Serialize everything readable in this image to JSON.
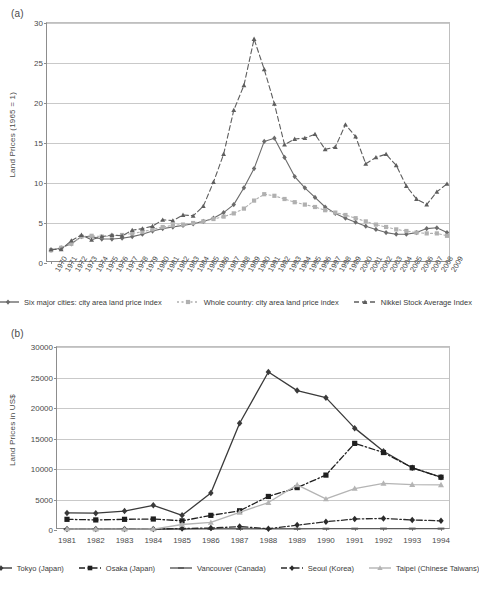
{
  "figure": {
    "panel_a_label": "(a)",
    "panel_b_label": "(b)"
  },
  "panel_a": {
    "ylabel": "Land Prices (1965 = 1)",
    "legend": [
      {
        "name": "six-major-cities",
        "label": "Six major cities: city area land price index",
        "color": "#6b6b6b",
        "marker": "diamond",
        "dash": "solid"
      },
      {
        "name": "whole-country",
        "label": "Whole country: city area land price index",
        "color": "#b0b0b0",
        "marker": "square",
        "dash": "dotted"
      },
      {
        "name": "nikkei",
        "label": "Nikkei Stock Average Index",
        "color": "#5e5e5e",
        "marker": "triangle",
        "dash": "dashed"
      }
    ]
  },
  "panel_b": {
    "ylabel": "Land Prices in US$",
    "legend": [
      {
        "name": "tokyo",
        "label": "Tokyo (Japan)",
        "color": "#3a3a3a",
        "marker": "diamond",
        "dash": "solid"
      },
      {
        "name": "osaka",
        "label": "Osaka (Japan)",
        "color": "#1f1f1f",
        "marker": "square",
        "dash": "dashdot"
      },
      {
        "name": "vancouver",
        "label": "Vancouver (Canada)",
        "color": "#5a5a5a",
        "marker": "dash",
        "dash": "solid"
      },
      {
        "name": "seoul",
        "label": "Seoul (Korea)",
        "color": "#2b2b2b",
        "marker": "diamond",
        "dash": "dashdot"
      },
      {
        "name": "taipei",
        "label": "Taipei (Chinese Taiwans)",
        "color": "#b4b4b4",
        "marker": "triangle",
        "dash": "solid"
      }
    ]
  },
  "chart_data": [
    {
      "type": "line",
      "panel": "(a)",
      "title": "",
      "xlabel": "",
      "ylabel": "Land Prices (1965 = 1)",
      "ylim": [
        0,
        30
      ],
      "yticks": [
        0,
        5,
        10,
        15,
        20,
        25,
        30
      ],
      "grid": true,
      "legend_position": "below",
      "categories": [
        "1970",
        "1971",
        "1972",
        "1973",
        "1974",
        "1975",
        "1976",
        "1977",
        "1978",
        "1979",
        "1980",
        "1981",
        "1982",
        "1983",
        "1984",
        "1985",
        "1986",
        "1987",
        "1988",
        "1989",
        "1990",
        "1991",
        "1992",
        "1993",
        "1994",
        "1995",
        "1996",
        "1997",
        "1998",
        "1999",
        "2000",
        "2001",
        "2002",
        "2003",
        "2004",
        "2005",
        "2006",
        "2007",
        "2008",
        "2009"
      ],
      "series": [
        {
          "name": "Six major cities: city area land price index",
          "color": "#6b6b6b",
          "marker": "diamond",
          "dash": "solid",
          "values": [
            1.6,
            1.9,
            2.4,
            3.3,
            3.3,
            3.0,
            3.0,
            3.1,
            3.3,
            3.6,
            4.0,
            4.3,
            4.5,
            4.7,
            4.9,
            5.2,
            5.6,
            6.3,
            7.3,
            9.4,
            11.8,
            15.2,
            15.6,
            13.2,
            10.8,
            9.4,
            8.2,
            7.0,
            6.2,
            5.6,
            5.1,
            4.6,
            4.2,
            3.8,
            3.6,
            3.6,
            3.8,
            4.3,
            4.4,
            3.8
          ]
        },
        {
          "name": "Whole country: city area land price index",
          "color": "#b0b0b0",
          "marker": "square",
          "dash": "dotted",
          "values": [
            1.6,
            1.9,
            2.4,
            3.3,
            3.4,
            3.3,
            3.4,
            3.5,
            3.7,
            3.9,
            4.2,
            4.5,
            4.7,
            4.8,
            5.0,
            5.2,
            5.5,
            5.8,
            6.2,
            6.8,
            7.8,
            8.6,
            8.4,
            8.0,
            7.6,
            7.3,
            7.0,
            6.6,
            6.3,
            6.0,
            5.6,
            5.2,
            4.8,
            4.5,
            4.2,
            4.0,
            3.8,
            3.7,
            3.7,
            3.4
          ]
        },
        {
          "name": "Nikkei Stock Average Index",
          "color": "#5e5e5e",
          "marker": "triangle",
          "dash": "dashed",
          "values": [
            1.7,
            1.7,
            2.8,
            3.5,
            2.9,
            3.3,
            3.5,
            3.4,
            4.1,
            4.3,
            4.6,
            5.4,
            5.3,
            6.0,
            5.9,
            7.1,
            10.1,
            13.6,
            19.1,
            22.2,
            28.0,
            24.2,
            19.9,
            14.8,
            15.5,
            15.6,
            16.1,
            14.2,
            14.5,
            17.3,
            15.8,
            12.4,
            13.2,
            13.6,
            12.2,
            9.6,
            8.0,
            7.3,
            8.9,
            9.9,
            13.2,
            13.7,
            9.6,
            7.3
          ]
        }
      ]
    },
    {
      "type": "line",
      "panel": "(b)",
      "title": "",
      "xlabel": "",
      "ylabel": "Land Prices in US$",
      "ylim": [
        0,
        30000
      ],
      "yticks": [
        0,
        5000,
        10000,
        15000,
        20000,
        25000,
        30000
      ],
      "grid": true,
      "legend_position": "below",
      "categories": [
        "1981",
        "1982",
        "1983",
        "1984",
        "1985",
        "1986",
        "1987",
        "1988",
        "1989",
        "1990",
        "1991",
        "1992",
        "1993",
        "1994"
      ],
      "series": [
        {
          "name": "Tokyo (Japan)",
          "color": "#3a3a3a",
          "marker": "diamond",
          "dash": "solid",
          "values": [
            2800,
            2750,
            3100,
            4050,
            2400,
            6050,
            17500,
            25900,
            22850,
            21700,
            16700,
            12900,
            10200,
            8650
          ]
        },
        {
          "name": "Osaka (Japan)",
          "color": "#1f1f1f",
          "marker": "square",
          "dash": "dashdot",
          "values": [
            1750,
            1650,
            1750,
            1800,
            1500,
            2400,
            3150,
            5500,
            6950,
            9000,
            14200,
            12700,
            10200,
            8650
          ]
        },
        {
          "name": "Vancouver (Canada)",
          "color": "#5a5a5a",
          "marker": "dash",
          "dash": "solid",
          "values": [
            150,
            120,
            110,
            110,
            150,
            170,
            180,
            190,
            200,
            210,
            220,
            230,
            230,
            230
          ]
        },
        {
          "name": "Seoul (Korea)",
          "color": "#2b2b2b",
          "marker": "diamond",
          "dash": "dashdot",
          "values": [
            170,
            150,
            160,
            170,
            250,
            320,
            560,
            200,
            800,
            1350,
            1800,
            1900,
            1650,
            1500
          ]
        },
        {
          "name": "Taipei (Chinese Taiwans)",
          "color": "#b4b4b4",
          "marker": "triangle",
          "dash": "solid",
          "values": [
            160,
            150,
            150,
            160,
            900,
            1250,
            2900,
            4500,
            7400,
            5100,
            6800,
            7650,
            7450,
            7400
          ]
        }
      ]
    }
  ]
}
